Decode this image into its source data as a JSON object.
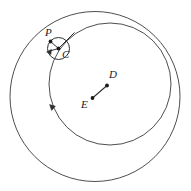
{
  "figure": {
    "type": "geometry-diagram",
    "width": 191,
    "height": 191,
    "background_color": "#ffffff",
    "stroke_color": "#3a3a3a",
    "label_color": "#1a1a1a"
  },
  "labels": {
    "p": "P",
    "c": "C",
    "d": "D",
    "e": "E"
  },
  "geometry": {
    "outer_circle": {
      "name": "outer-circle",
      "center_x": 95,
      "center_y": 96.5,
      "radius": 85,
      "center_label": "E"
    },
    "inner_circle": {
      "name": "inner-circle",
      "center_x": 110,
      "center_y": 84,
      "radius": 61,
      "center_label": "D"
    },
    "small_circle": {
      "name": "small-circle",
      "center_x": 58.5,
      "center_y": 48.5,
      "radius": 11,
      "center_label": "C"
    },
    "points": [
      {
        "name": "point-p",
        "label": "P",
        "x": 50.5,
        "y": 41.5,
        "label_x": 45,
        "label_y": 27
      },
      {
        "name": "point-c",
        "label": "C",
        "x": 58.5,
        "y": 48.5,
        "label_x": 62,
        "label_y": 50
      },
      {
        "name": "point-d",
        "label": "D",
        "x": 107,
        "y": 85.5,
        "label_x": 108,
        "label_y": 70
      },
      {
        "name": "point-e",
        "label": "E",
        "x": 92.5,
        "y": 98,
        "label_x": 81,
        "label_y": 100
      }
    ],
    "segments": [
      {
        "name": "segment-ed",
        "x1": 92.5,
        "y1": 98,
        "x2": 107,
        "y2": 85.5
      },
      {
        "name": "segment-cp",
        "x1": 58.5,
        "y1": 48.5,
        "x2": 50.5,
        "y2": 41.5
      },
      {
        "name": "segment-c-left",
        "x1": 58.5,
        "y1": 48.5,
        "x2": 47.8,
        "y2": 51.5
      },
      {
        "name": "segment-c-upper-right",
        "x1": 58.5,
        "y1": 48.5,
        "x2": 74,
        "y2": 33
      }
    ],
    "arrow_markers": [
      {
        "name": "arrow-marker-small-circle",
        "x": 47.8,
        "y": 51.5,
        "angle_deg": 196
      },
      {
        "name": "arrow-marker-inner-circle",
        "x": 52.5,
        "y": 108,
        "angle_deg": 104
      }
    ]
  }
}
